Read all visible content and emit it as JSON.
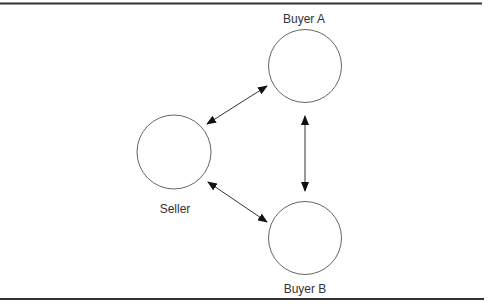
{
  "diagram": {
    "nodes": [
      {
        "id": "buyer_a",
        "label": "Buyer A"
      },
      {
        "id": "seller",
        "label": "Seller"
      },
      {
        "id": "buyer_b",
        "label": "Buyer B"
      }
    ],
    "edges": [
      {
        "from": "seller",
        "to": "buyer_a",
        "direction": "bidirectional"
      },
      {
        "from": "seller",
        "to": "buyer_b",
        "direction": "bidirectional"
      },
      {
        "from": "buyer_a",
        "to": "buyer_b",
        "direction": "bidirectional"
      }
    ],
    "colors": {
      "stroke": "#555555",
      "rule": "#333333",
      "text": "#333333",
      "arrow": "#111111"
    }
  }
}
